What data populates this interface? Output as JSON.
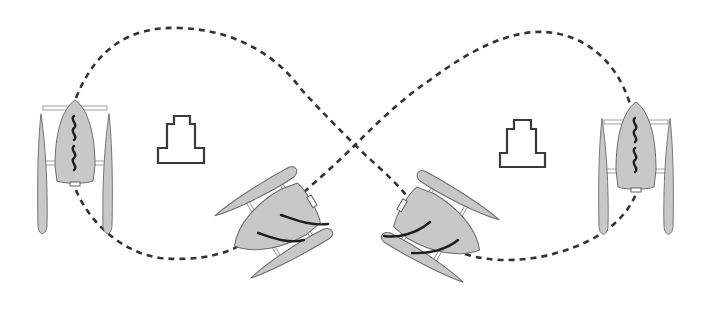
{
  "diagram": {
    "title": "Figure-eight trajectory of a trimaran vessel around two obstacles",
    "path": {
      "style": "dashed",
      "color": "#333333",
      "shape": "figure-eight"
    },
    "vessels": [
      {
        "id": "vessel-1",
        "label": "Trimaran heading north (left loop)",
        "heading": "north",
        "wake": "wavy",
        "hull_color": "#c8c8c8"
      },
      {
        "id": "vessel-2",
        "label": "Trimaran turning (lower-left)",
        "heading": "south-west",
        "wake": "curved",
        "hull_color": "#c8c8c8"
      },
      {
        "id": "vessel-3",
        "label": "Trimaran turning (lower-right)",
        "heading": "south-east",
        "wake": "curved",
        "hull_color": "#c8c8c8"
      },
      {
        "id": "vessel-4",
        "label": "Trimaran heading north (right loop)",
        "heading": "north",
        "wake": "wavy",
        "hull_color": "#c8c8c8"
      }
    ],
    "obstacles": [
      {
        "id": "obstacle-left",
        "label": "Stepped obstacle (left loop)"
      },
      {
        "id": "obstacle-right",
        "label": "Stepped obstacle (right loop)"
      }
    ]
  }
}
